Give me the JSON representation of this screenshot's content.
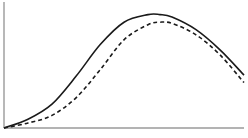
{
  "chart_data": {
    "type": "line",
    "title": "",
    "xlabel": "",
    "ylabel": "",
    "grid": false,
    "legend": null,
    "xlim": [
      0,
      10
    ],
    "ylim": [
      0,
      1
    ],
    "x": [
      0,
      1,
      2,
      3,
      4,
      5,
      6,
      6.5,
      7,
      8,
      9,
      10
    ],
    "series": [
      {
        "name": "solid",
        "style": "solid",
        "color": "#1a1a1a",
        "values": [
          0.0,
          0.07,
          0.19,
          0.41,
          0.66,
          0.84,
          0.9,
          0.9,
          0.88,
          0.78,
          0.62,
          0.42
        ]
      },
      {
        "name": "dashed",
        "style": "dashed",
        "color": "#1a1a1a",
        "values": [
          0.0,
          0.04,
          0.1,
          0.24,
          0.46,
          0.7,
          0.82,
          0.84,
          0.83,
          0.74,
          0.58,
          0.36
        ]
      }
    ]
  }
}
